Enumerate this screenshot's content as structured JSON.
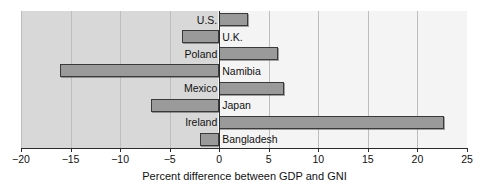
{
  "chart_data": {
    "type": "bar",
    "orientation": "horizontal",
    "title": "",
    "xlabel": "Percent difference between GDP and GNI",
    "ylabel": "",
    "xlim": [
      -20,
      25
    ],
    "xticks": [
      -20,
      -15,
      -10,
      -5,
      0,
      5,
      10,
      15,
      20,
      25
    ],
    "xticklabels": [
      "−20",
      "−15",
      "−10",
      "−5",
      "0",
      "5",
      "10",
      "15",
      "20",
      "25"
    ],
    "grid": true,
    "legend": null,
    "categories": [
      "U.S.",
      "U.K.",
      "Poland",
      "Namibia",
      "Mexico",
      "Japan",
      "Ireland",
      "Bangladesh"
    ],
    "values": [
      2.9,
      -3.8,
      5.9,
      -16.1,
      6.5,
      -6.9,
      22.7,
      -1.9
    ],
    "bar_color": "#9a9a9a",
    "bar_edge_color": "#3a3a3a",
    "zero_line_color": "#2b2b2b",
    "plot_bg_negative": "#d8d8d8",
    "plot_bg_positive": "#f4f4f4"
  },
  "axis": {
    "title": "Percent difference between GDP and GNI"
  }
}
